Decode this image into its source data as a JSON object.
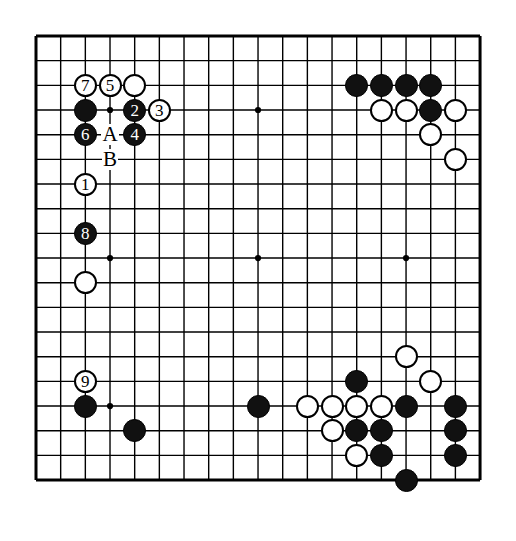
{
  "diagram": {
    "type": "go-board-diagram",
    "board_size": 19,
    "background_color": "#ffffff",
    "line_color": "#000000",
    "black_color": "#111111",
    "white_color": "#ffffff",
    "geometry": {
      "origin_x": 36,
      "origin_y": 36,
      "spacing": 24.67,
      "stone_diameter": 23,
      "border_width": 3
    },
    "star_points": [
      {
        "col": 3,
        "row": 3
      },
      {
        "col": 9,
        "row": 3
      },
      {
        "col": 15,
        "row": 3
      },
      {
        "col": 3,
        "row": 9
      },
      {
        "col": 9,
        "row": 9
      },
      {
        "col": 15,
        "row": 9
      },
      {
        "col": 3,
        "row": 15
      },
      {
        "col": 9,
        "row": 15
      },
      {
        "col": 15,
        "row": 15
      }
    ],
    "numbered_stones": [
      {
        "label": "1",
        "color": "white",
        "col": 2,
        "row": 6
      },
      {
        "label": "2",
        "color": "black",
        "col": 4,
        "row": 3
      },
      {
        "label": "3",
        "color": "white",
        "col": 5,
        "row": 3
      },
      {
        "label": "4",
        "color": "black",
        "col": 4,
        "row": 4
      },
      {
        "label": "5",
        "color": "white",
        "col": 3,
        "row": 2
      },
      {
        "label": "6",
        "color": "black",
        "col": 2,
        "row": 4
      },
      {
        "label": "7",
        "color": "white",
        "col": 2,
        "row": 2
      },
      {
        "label": "8",
        "color": "black",
        "col": 2,
        "row": 8
      },
      {
        "label": "9",
        "color": "white",
        "col": 2,
        "row": 14
      }
    ],
    "point_labels": [
      {
        "label": "A",
        "col": 3,
        "row": 4
      },
      {
        "label": "B",
        "col": 3,
        "row": 5
      }
    ],
    "plain_stones": [
      {
        "color": "black",
        "col": 2,
        "row": 3
      },
      {
        "color": "white",
        "col": 4,
        "row": 2
      },
      {
        "color": "white",
        "col": 2,
        "row": 10
      },
      {
        "color": "black",
        "col": 2,
        "row": 15
      },
      {
        "color": "black",
        "col": 4,
        "row": 16
      },
      {
        "color": "black",
        "col": 9,
        "row": 15
      },
      {
        "color": "black",
        "col": 13,
        "row": 2
      },
      {
        "color": "black",
        "col": 14,
        "row": 2
      },
      {
        "color": "black",
        "col": 15,
        "row": 2
      },
      {
        "color": "black",
        "col": 16,
        "row": 2
      },
      {
        "color": "white",
        "col": 14,
        "row": 3
      },
      {
        "color": "white",
        "col": 15,
        "row": 3
      },
      {
        "color": "black",
        "col": 16,
        "row": 3
      },
      {
        "color": "white",
        "col": 17,
        "row": 3
      },
      {
        "color": "white",
        "col": 16,
        "row": 4
      },
      {
        "color": "white",
        "col": 17,
        "row": 5
      },
      {
        "color": "white",
        "col": 15,
        "row": 13
      },
      {
        "color": "black",
        "col": 13,
        "row": 14
      },
      {
        "color": "white",
        "col": 16,
        "row": 14
      },
      {
        "color": "white",
        "col": 11,
        "row": 15
      },
      {
        "color": "white",
        "col": 12,
        "row": 15
      },
      {
        "color": "white",
        "col": 13,
        "row": 15
      },
      {
        "color": "white",
        "col": 14,
        "row": 15
      },
      {
        "color": "black",
        "col": 15,
        "row": 15
      },
      {
        "color": "black",
        "col": 17,
        "row": 15
      },
      {
        "color": "white",
        "col": 12,
        "row": 16
      },
      {
        "color": "black",
        "col": 13,
        "row": 16
      },
      {
        "color": "black",
        "col": 14,
        "row": 16
      },
      {
        "color": "black",
        "col": 17,
        "row": 16
      },
      {
        "color": "white",
        "col": 13,
        "row": 17
      },
      {
        "color": "black",
        "col": 14,
        "row": 17
      },
      {
        "color": "black",
        "col": 17,
        "row": 17
      },
      {
        "color": "black",
        "col": 15,
        "row": 18
      }
    ]
  }
}
